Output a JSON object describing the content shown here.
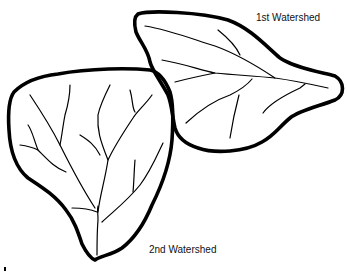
{
  "diagram": {
    "type": "watershed-drainage-sketch",
    "watersheds": [
      {
        "id": "ws1",
        "label": "1st Watershed",
        "position": "upper-right"
      },
      {
        "id": "ws2",
        "label": "2nd Watershed",
        "position": "lower-left"
      }
    ],
    "colors": {
      "line": "#000000",
      "background": "#ffffff"
    }
  }
}
